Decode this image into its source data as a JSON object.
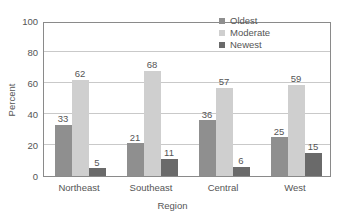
{
  "chart_data": {
    "type": "bar",
    "title": "",
    "xlabel": "Region",
    "ylabel": "Percent",
    "categories": [
      "Northeast",
      "Southeast",
      "Central",
      "West"
    ],
    "series": [
      {
        "name": "Oldest",
        "values": [
          33,
          21,
          36,
          25
        ],
        "color": "#8f8f8f"
      },
      {
        "name": "Moderate",
        "values": [
          62,
          68,
          57,
          59
        ],
        "color": "#cfcfcf"
      },
      {
        "name": "Newest",
        "values": [
          5,
          11,
          6,
          15
        ],
        "color": "#6a6a6a"
      }
    ],
    "ylim": [
      0,
      100
    ],
    "yticks": [
      0,
      20,
      40,
      60,
      80,
      100
    ],
    "grid": true,
    "legend_position": "top-right",
    "data_labels": true,
    "axis_color": "#8a8a8a",
    "grid_color": "#c9c9c9",
    "text_color": "#555555"
  }
}
